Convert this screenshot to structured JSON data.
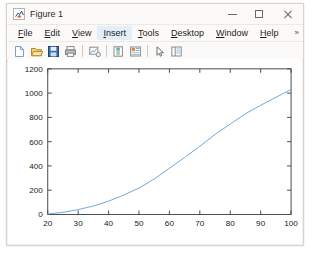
{
  "window": {
    "title": "Figure 1",
    "icon": "matlab-figure-icon",
    "buttons": {
      "minimize": "–",
      "maximize": "□",
      "close": "✕"
    }
  },
  "menubar": {
    "items": [
      {
        "label": "File",
        "mnemonic": "F",
        "active": false
      },
      {
        "label": "Edit",
        "mnemonic": "E",
        "active": false
      },
      {
        "label": "View",
        "mnemonic": "V",
        "active": false
      },
      {
        "label": "Insert",
        "mnemonic": "I",
        "active": true
      },
      {
        "label": "Tools",
        "mnemonic": "T",
        "active": false
      },
      {
        "label": "Desktop",
        "mnemonic": "D",
        "active": false
      },
      {
        "label": "Window",
        "mnemonic": "W",
        "active": false
      },
      {
        "label": "Help",
        "mnemonic": "H",
        "active": false
      }
    ],
    "overflow_label": "»"
  },
  "toolbar": {
    "items": [
      {
        "name": "new-figure-icon",
        "tooltip": "New Figure"
      },
      {
        "name": "open-file-icon",
        "tooltip": "Open File"
      },
      {
        "name": "save-figure-icon",
        "tooltip": "Save Figure"
      },
      {
        "name": "print-figure-icon",
        "tooltip": "Print Figure"
      },
      {
        "name": "link-plot-icon",
        "tooltip": "Link Plot"
      },
      {
        "name": "insert-colorbar-icon",
        "tooltip": "Insert Colorbar"
      },
      {
        "name": "insert-legend-icon",
        "tooltip": "Insert Legend"
      },
      {
        "name": "edit-plot-icon",
        "tooltip": "Edit Plot"
      },
      {
        "name": "hide-plot-tools-icon",
        "tooltip": "Hide Plot Tools"
      }
    ]
  },
  "chart_data": {
    "type": "line",
    "title": "",
    "xlabel": "",
    "ylabel": "",
    "xlim": [
      20,
      100
    ],
    "ylim": [
      0,
      1200
    ],
    "xticks": [
      20,
      30,
      40,
      50,
      60,
      70,
      80,
      90,
      100
    ],
    "yticks": [
      0,
      200,
      400,
      600,
      800,
      1000,
      1200
    ],
    "grid": false,
    "legend": null,
    "line_color": "#6ea8dc",
    "line_width": 1,
    "series": [
      {
        "name": "curve",
        "x": [
          20,
          25,
          30,
          35,
          40,
          45,
          50,
          55,
          60,
          65,
          70,
          75,
          80,
          85,
          90,
          95,
          100
        ],
        "y": [
          4,
          18,
          40,
          70,
          110,
          160,
          218,
          292,
          380,
          470,
          562,
          660,
          745,
          830,
          900,
          965,
          1030
        ]
      }
    ]
  }
}
